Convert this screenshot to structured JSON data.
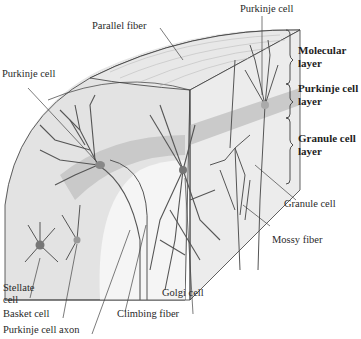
{
  "figure": {
    "colors": {
      "tissue_light": "#e3e3e3",
      "tissue_face": "#ececec",
      "purkinje_band": "#c8c8c8",
      "white_matter": "#f4f4f4",
      "neuron": "#5a5a5a",
      "outline": "#3a3a3a",
      "leader_line": "#444444",
      "text": "#2a2a2a"
    }
  },
  "labels": {
    "parallel_fiber": "Parallel fiber",
    "purkinje_cell_top": "Purkinje cell",
    "purkinje_cell_left": "Purkinje cell",
    "granule_cell": "Granule cell",
    "mossy_fiber": "Mossy fiber",
    "stellate_cell_line1": "Stellate",
    "stellate_cell_line2": "cell",
    "basket_cell": "Basket cell",
    "purkinje_cell_axon": "Purkinje cell axon",
    "climbing_fiber": "Climbing fiber",
    "golgi_cell": "Golgi cell"
  },
  "layers": [
    {
      "line1": "Molecular",
      "line2": "layer"
    },
    {
      "line1": "Purkinje cell",
      "line2": "layer"
    },
    {
      "line1": "Granule cell",
      "line2": "layer"
    }
  ]
}
